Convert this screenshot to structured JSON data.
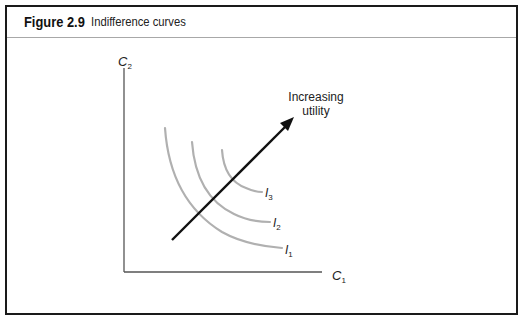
{
  "figure": {
    "number": "Figure 2.9",
    "title": "Indifference curves"
  },
  "diagram": {
    "y_axis_label": "C",
    "y_axis_sub": "2",
    "x_axis_label": "C",
    "x_axis_sub": "1",
    "arrow_label_line1": "Increasing",
    "arrow_label_line2": "utility",
    "curves": [
      {
        "label": "I",
        "sub": "1"
      },
      {
        "label": "I",
        "sub": "2"
      },
      {
        "label": "I",
        "sub": "3"
      }
    ],
    "colors": {
      "curve": "#b0b0b0",
      "axis": "#555555",
      "arrow": "#111111"
    }
  }
}
